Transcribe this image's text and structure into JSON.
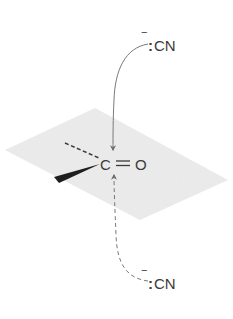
{
  "diagram": {
    "type": "reaction-mechanism",
    "colors": {
      "plane": "#ebebeb",
      "ink": "#3a3a3a",
      "arrow": "#7a7a7a"
    },
    "carbonyl": {
      "carbon_label": "C",
      "oxygen_label": "O",
      "bond": "double"
    },
    "nucleophile_top": {
      "charge": "−",
      "lone_pair": ":",
      "label": "CN"
    },
    "nucleophile_bottom": {
      "charge": "−",
      "lone_pair": ":",
      "label": "CN"
    },
    "arrows": [
      {
        "from": "nucleophile_top",
        "to": "carbonyl_carbon",
        "style": "solid"
      },
      {
        "from": "nucleophile_bottom",
        "to": "carbonyl_carbon",
        "style": "dashed"
      }
    ],
    "substituents": [
      {
        "bond": "dashed",
        "direction": "back-left"
      },
      {
        "bond": "wedge",
        "direction": "front-left"
      }
    ]
  }
}
